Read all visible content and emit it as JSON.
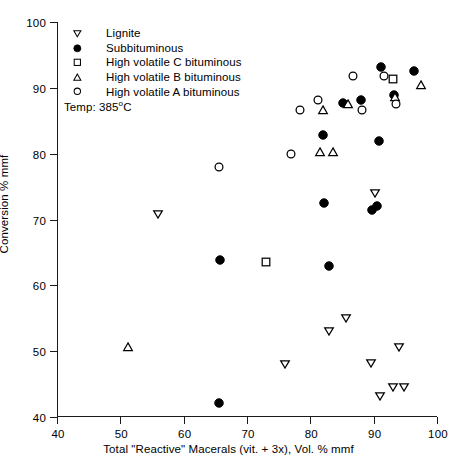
{
  "chart_data": {
    "type": "scatter",
    "title": "",
    "xlabel": "Total \"Reactive\" Macerals (vit. + 3x), Vol. % mmf",
    "ylabel": "Conversion % mmf",
    "xlim": [
      40,
      100
    ],
    "ylim": [
      40,
      100
    ],
    "xticks": [
      40,
      50,
      60,
      70,
      80,
      90,
      100
    ],
    "yticks": [
      40,
      50,
      60,
      70,
      80,
      90,
      100
    ],
    "grid": false,
    "legend_position": "top-left",
    "annotations": [
      {
        "name": "temperature-note",
        "text": "Temp: 385",
        "sup": "o",
        "text_after": "C"
      }
    ],
    "series": [
      {
        "name": "Lignite",
        "marker": "down-triangle",
        "filled": false,
        "points": [
          {
            "x": 56.0,
            "y": 70.9
          },
          {
            "x": 76.0,
            "y": 48.1
          },
          {
            "x": 83.0,
            "y": 53.0
          },
          {
            "x": 85.7,
            "y": 55.0
          },
          {
            "x": 89.6,
            "y": 48.2
          },
          {
            "x": 90.2,
            "y": 74.0
          },
          {
            "x": 91.0,
            "y": 43.2
          },
          {
            "x": 93.0,
            "y": 44.6
          },
          {
            "x": 94.0,
            "y": 50.6
          },
          {
            "x": 94.8,
            "y": 44.5
          }
        ]
      },
      {
        "name": "Subbituminous",
        "marker": "circle",
        "filled": true,
        "points": [
          {
            "x": 65.5,
            "y": 42.2
          },
          {
            "x": 65.8,
            "y": 63.9
          },
          {
            "x": 83.0,
            "y": 62.9
          },
          {
            "x": 82.2,
            "y": 72.5
          },
          {
            "x": 82.0,
            "y": 82.8
          },
          {
            "x": 85.2,
            "y": 87.7
          },
          {
            "x": 88.0,
            "y": 88.2
          },
          {
            "x": 89.8,
            "y": 71.4
          },
          {
            "x": 90.6,
            "y": 72.1
          },
          {
            "x": 90.9,
            "y": 82.0
          },
          {
            "x": 91.1,
            "y": 93.1
          },
          {
            "x": 93.2,
            "y": 88.9
          },
          {
            "x": 96.4,
            "y": 92.6
          }
        ]
      },
      {
        "name": "High volatile C bituminous",
        "marker": "square",
        "filled": false,
        "points": [
          {
            "x": 73.0,
            "y": 63.5
          },
          {
            "x": 93.0,
            "y": 91.4
          }
        ]
      },
      {
        "name": "High volatile B bituminous",
        "marker": "up-triangle",
        "filled": false,
        "points": [
          {
            "x": 51.2,
            "y": 50.6
          },
          {
            "x": 81.5,
            "y": 80.2
          },
          {
            "x": 83.6,
            "y": 80.3
          },
          {
            "x": 82.0,
            "y": 86.7
          },
          {
            "x": 86.0,
            "y": 87.5
          },
          {
            "x": 93.4,
            "y": 88.6
          },
          {
            "x": 97.4,
            "y": 90.4
          }
        ]
      },
      {
        "name": "High volatile A bituminous",
        "marker": "circle",
        "filled": false,
        "points": [
          {
            "x": 65.6,
            "y": 78.0
          },
          {
            "x": 77.0,
            "y": 80.0
          },
          {
            "x": 78.4,
            "y": 86.6
          },
          {
            "x": 81.2,
            "y": 88.1
          },
          {
            "x": 86.8,
            "y": 91.8
          },
          {
            "x": 88.2,
            "y": 86.6
          },
          {
            "x": 93.6,
            "y": 87.5
          },
          {
            "x": 91.6,
            "y": 91.8
          }
        ]
      }
    ]
  }
}
